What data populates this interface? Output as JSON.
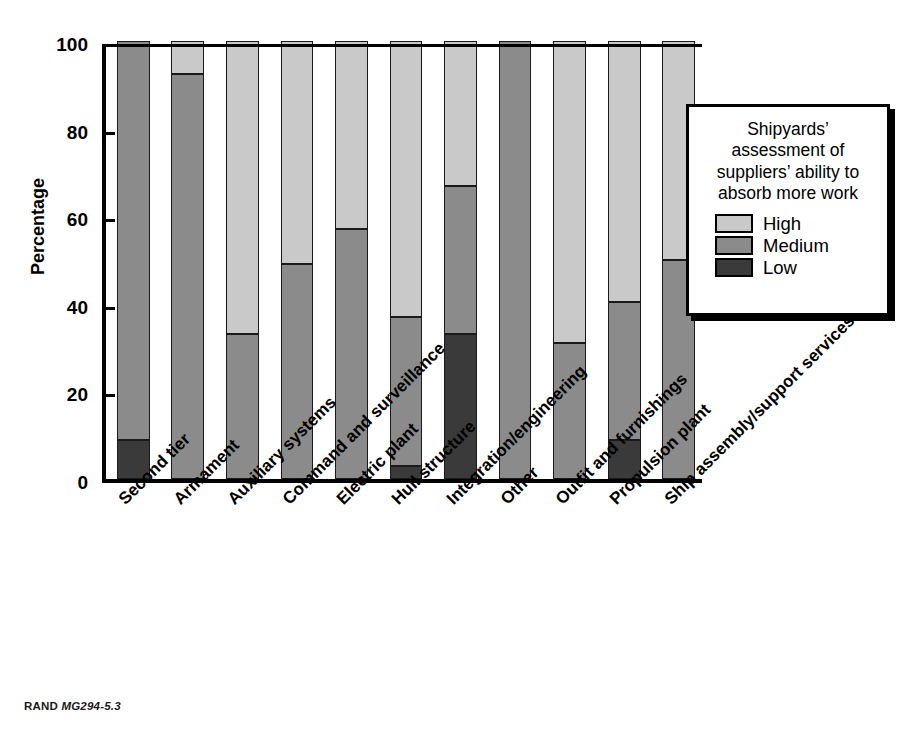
{
  "figure": {
    "footer_source": "RAND",
    "footer_id": "MG294-5.3"
  },
  "legend": {
    "title": "Shipyards’ assessment of suppliers’ ability to absorb more work",
    "items": [
      {
        "label": "High",
        "color": "#c9c9c9"
      },
      {
        "label": "Medium",
        "color": "#8b8b8b"
      },
      {
        "label": "Low",
        "color": "#3a3a3a"
      }
    ]
  },
  "chart_data": {
    "type": "bar",
    "subtype": "stacked-vertical-100pct",
    "title": "",
    "xlabel": "",
    "ylabel": "Percentage",
    "ylim": [
      0,
      100
    ],
    "yticks": [
      0,
      20,
      40,
      60,
      80,
      100
    ],
    "grid": false,
    "legend_position": "right-inside",
    "categories": [
      "Second tier",
      "Armament",
      "Auxiliary systems",
      "Command and surveillance",
      "Electric plant",
      "Hull structure",
      "Integration/engineering",
      "Other",
      "Outfit and furnishings",
      "Propulsion plant",
      "Ship assembly/support services"
    ],
    "series": [
      {
        "name": "High",
        "color": "#c9c9c9",
        "values": [
          0,
          7.5,
          67,
          51,
          43,
          63,
          33,
          0,
          69,
          59.5,
          50
        ]
      },
      {
        "name": "Medium",
        "color": "#8b8b8b",
        "values": [
          91,
          92.5,
          33,
          49,
          57,
          34,
          34,
          100,
          31,
          31.5,
          50
        ]
      },
      {
        "name": "Low",
        "color": "#3a3a3a",
        "values": [
          9,
          0,
          0,
          0,
          0,
          3,
          33,
          0,
          0,
          9,
          0
        ]
      }
    ],
    "stack_boundaries_pct": {
      "Second tier": {
        "low_top": 9,
        "medium_top": 100
      },
      "Armament": {
        "low_top": 0,
        "medium_top": 92.5
      },
      "Auxiliary systems": {
        "low_top": 0,
        "medium_top": 33
      },
      "Command and surveillance": {
        "low_top": 0,
        "medium_top": 49
      },
      "Electric plant": {
        "low_top": 0,
        "medium_top": 57
      },
      "Hull structure": {
        "low_top": 3,
        "medium_top": 37
      },
      "Integration/engineering": {
        "low_top": 33,
        "medium_top": 67
      },
      "Other": {
        "low_top": 0,
        "medium_top": 100
      },
      "Outfit and furnishings": {
        "low_top": 0,
        "medium_top": 31
      },
      "Propulsion plant": {
        "low_top": 9,
        "medium_top": 40.5
      },
      "Ship assembly/support services": {
        "low_top": 0,
        "medium_top": 50
      }
    }
  }
}
